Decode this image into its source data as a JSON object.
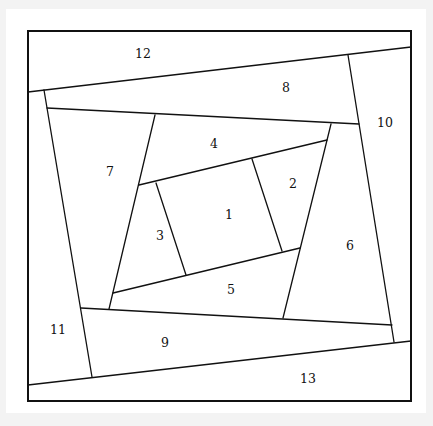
{
  "diagram": {
    "type": "foundation paper piecing block (log-cabin spiral)",
    "frame": {
      "x1": 28,
      "y1": 31,
      "x2": 411,
      "y2": 401
    },
    "stroke_color": "#111111",
    "background_color": "#ffffff",
    "segments": [
      {
        "id": "1",
        "label": "1",
        "lx": 229,
        "ly": 215
      },
      {
        "id": "2",
        "label": "2",
        "lx": 293,
        "ly": 184
      },
      {
        "id": "3",
        "label": "3",
        "lx": 160,
        "ly": 236
      },
      {
        "id": "4",
        "label": "4",
        "lx": 214,
        "ly": 144
      },
      {
        "id": "5",
        "label": "5",
        "lx": 231,
        "ly": 290
      },
      {
        "id": "6",
        "label": "6",
        "lx": 350,
        "ly": 246
      },
      {
        "id": "7",
        "label": "7",
        "lx": 110,
        "ly": 172
      },
      {
        "id": "8",
        "label": "8",
        "lx": 286,
        "ly": 88
      },
      {
        "id": "9",
        "label": "9",
        "lx": 165,
        "ly": 343
      },
      {
        "id": "10",
        "label": "10",
        "lx": 385,
        "ly": 123
      },
      {
        "id": "11",
        "label": "11",
        "lx": 58,
        "ly": 330
      },
      {
        "id": "12",
        "label": "12",
        "lx": 143,
        "ly": 54
      },
      {
        "id": "13",
        "label": "13",
        "lx": 308,
        "ly": 379
      }
    ]
  }
}
